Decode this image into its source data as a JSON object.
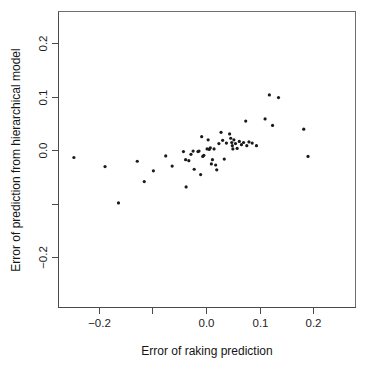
{
  "chart_data": {
    "type": "scatter",
    "title": "",
    "xlabel": "Error of raking prediction",
    "ylabel": "Error of prediction from hierarchical model",
    "xlim": [
      -0.262,
      0.262
    ],
    "ylim": [
      -0.272,
      0.258
    ],
    "grid": false,
    "legend": null,
    "xticks": [
      -0.2,
      -0.1,
      0.0,
      0.1,
      0.2
    ],
    "xticklabels": [
      "-0.2",
      "",
      "0.0",
      "0.1",
      "0.2"
    ],
    "yticks": [
      -0.2,
      -0.1,
      0.0,
      0.1,
      0.2
    ],
    "yticklabels": [
      "-0.2",
      "",
      "0.0",
      "0.1",
      "0.2"
    ],
    "marker": "point",
    "marker_color": "#1a1a1a",
    "marker_size": 1.6,
    "n_points": 57,
    "points": [
      {
        "x": -0.246,
        "y": -0.014
      },
      {
        "x": -0.188,
        "y": -0.031
      },
      {
        "x": -0.163,
        "y": -0.099
      },
      {
        "x": -0.128,
        "y": -0.021
      },
      {
        "x": -0.115,
        "y": -0.059
      },
      {
        "x": -0.098,
        "y": -0.039
      },
      {
        "x": -0.075,
        "y": -0.011
      },
      {
        "x": -0.063,
        "y": -0.03
      },
      {
        "x": -0.042,
        "y": -0.003
      },
      {
        "x": -0.038,
        "y": -0.018
      },
      {
        "x": -0.037,
        "y": -0.069
      },
      {
        "x": -0.032,
        "y": -0.02
      },
      {
        "x": -0.028,
        "y": -0.008
      },
      {
        "x": -0.024,
        "y": -0.002
      },
      {
        "x": -0.022,
        "y": -0.036
      },
      {
        "x": -0.015,
        "y": -0.003
      },
      {
        "x": -0.013,
        "y": -0.002
      },
      {
        "x": -0.01,
        "y": -0.046
      },
      {
        "x": -0.008,
        "y": 0.025
      },
      {
        "x": -0.006,
        "y": -0.012
      },
      {
        "x": -0.004,
        "y": -0.01
      },
      {
        "x": 0.002,
        "y": 0.002
      },
      {
        "x": 0.004,
        "y": 0.019
      },
      {
        "x": 0.006,
        "y": 0.001
      },
      {
        "x": 0.008,
        "y": 0.004
      },
      {
        "x": 0.01,
        "y": -0.026
      },
      {
        "x": 0.012,
        "y": -0.018
      },
      {
        "x": 0.015,
        "y": 0.002
      },
      {
        "x": 0.018,
        "y": -0.028
      },
      {
        "x": 0.02,
        "y": -0.037
      },
      {
        "x": 0.024,
        "y": 0.012
      },
      {
        "x": 0.028,
        "y": 0.033
      },
      {
        "x": 0.031,
        "y": 0.018
      },
      {
        "x": 0.034,
        "y": -0.017
      },
      {
        "x": 0.038,
        "y": 0.013
      },
      {
        "x": 0.044,
        "y": 0.03
      },
      {
        "x": 0.046,
        "y": 0.022
      },
      {
        "x": 0.048,
        "y": 0.014
      },
      {
        "x": 0.049,
        "y": 0.008
      },
      {
        "x": 0.05,
        "y": 0.002
      },
      {
        "x": 0.052,
        "y": 0.019
      },
      {
        "x": 0.055,
        "y": 0.012
      },
      {
        "x": 0.058,
        "y": 0.003
      },
      {
        "x": 0.062,
        "y": 0.016
      },
      {
        "x": 0.066,
        "y": 0.01
      },
      {
        "x": 0.07,
        "y": 0.014
      },
      {
        "x": 0.074,
        "y": 0.054
      },
      {
        "x": 0.076,
        "y": 0.008
      },
      {
        "x": 0.08,
        "y": 0.015
      },
      {
        "x": 0.086,
        "y": 0.013
      },
      {
        "x": 0.094,
        "y": 0.008
      },
      {
        "x": 0.11,
        "y": 0.058
      },
      {
        "x": 0.118,
        "y": 0.103
      },
      {
        "x": 0.124,
        "y": 0.046
      },
      {
        "x": 0.135,
        "y": 0.098
      },
      {
        "x": 0.182,
        "y": 0.039
      },
      {
        "x": 0.19,
        "y": -0.012
      }
    ]
  },
  "axes": {
    "x_title": "Error of raking prediction",
    "y_title": "Error of prediction from hierarchical model",
    "x_tick_labels": [
      "-0.2",
      "0.0",
      "0.1",
      "0.2"
    ],
    "y_tick_labels": [
      "0.2",
      "0.1",
      "0.0",
      "-0.2"
    ]
  }
}
